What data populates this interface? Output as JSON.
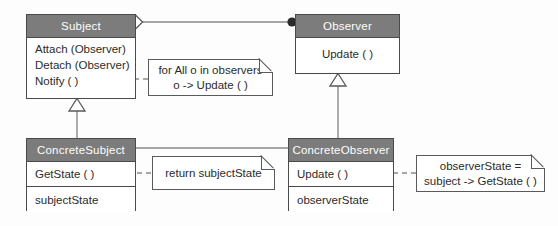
{
  "diagram": {
    "type": "uml-class-diagram",
    "colors": {
      "header_fill": "#7c7c7c",
      "header_text": "#ffffff",
      "body_fill": "#ffffff",
      "border": "#4a4a4a",
      "line": "#8a8a8a",
      "background": "#fdfdfd"
    },
    "classes": [
      {
        "id": "subject",
        "name": "Subject",
        "operations": [
          "Attach (Observer)",
          "Detach (Observer)",
          "Notify ( )"
        ],
        "attributes": []
      },
      {
        "id": "observer",
        "name": "Observer",
        "operations": [
          "Update ( )"
        ],
        "attributes": []
      },
      {
        "id": "concrete-subject",
        "name": "ConcreteSubject",
        "operations": [
          "GetState ( )"
        ],
        "attributes": [
          "subjectState"
        ]
      },
      {
        "id": "concrete-observer",
        "name": "ConcreteObserver",
        "operations": [
          "Update ( )"
        ],
        "attributes": [
          "observerState"
        ]
      }
    ],
    "notes": [
      {
        "id": "notify-note",
        "lines": [
          "for All o in observers",
          "o -> Update ( )"
        ],
        "attached_to": "Notify ( )"
      },
      {
        "id": "getstate-note",
        "lines": [
          "return subjectState"
        ],
        "attached_to": "GetState ( )"
      },
      {
        "id": "update-note",
        "lines": [
          "observerState =",
          "subject -> GetState ( )"
        ],
        "attached_to": "Update ( )"
      }
    ],
    "relationships": [
      {
        "from": "Subject",
        "to": "Observer",
        "type": "aggregation"
      },
      {
        "from": "ConcreteSubject",
        "to": "Subject",
        "type": "generalization"
      },
      {
        "from": "ConcreteObserver",
        "to": "Observer",
        "type": "generalization"
      },
      {
        "from": "ConcreteSubject",
        "to": "ConcreteObserver",
        "type": "association"
      }
    ]
  }
}
